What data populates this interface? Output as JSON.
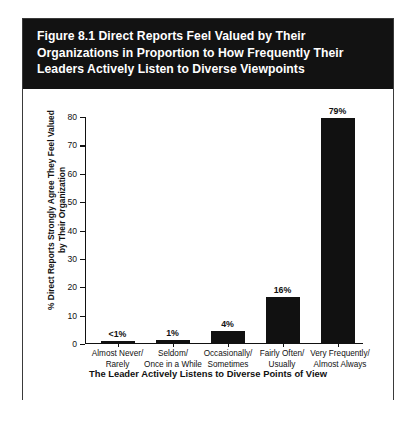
{
  "figure": {
    "title": "Figure 8.1  Direct Reports Feel Valued by Their\nOrganizations in Proportion to How Frequently Their\nLeaders Actively Listen to Diverse Viewpoints"
  },
  "chart_data": {
    "type": "bar",
    "title": "Figure 8.1  Direct Reports Feel Valued by Their Organizations in Proportion to How Frequently Their Leaders Actively Listen to Diverse Viewpoints",
    "xlabel": "The Leader Actively Listens to Diverse Points of View",
    "ylabel": "% Direct Reports Strongly Agree They Feel Valued\nby Their Organization",
    "categories": [
      "Almost Never/\nRarely",
      "Seldom/\nOnce in a While",
      "Occasionally/\nSometimes",
      "Fairly Often/\nUsually",
      "Very Frequently/\nAlmost Always"
    ],
    "values": [
      0.5,
      1,
      4,
      16,
      79
    ],
    "value_labels": [
      "<1%",
      "1%",
      "4%",
      "16%",
      "79%"
    ],
    "ylim": [
      0,
      80
    ],
    "yticks": [
      0,
      10,
      20,
      30,
      40,
      50,
      60,
      70,
      80
    ],
    "ytick_labels": [
      "0",
      "10",
      "20",
      "30",
      "40",
      "50",
      "60",
      "70",
      "80"
    ],
    "grid": false,
    "legend": "none",
    "bar_color": "#111111",
    "banner_color": "#121212"
  }
}
